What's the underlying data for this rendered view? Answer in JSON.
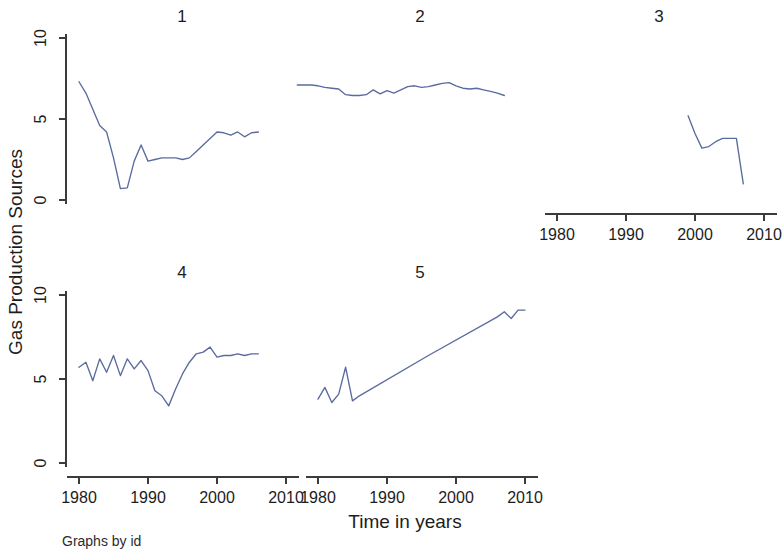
{
  "figure": {
    "ylabel": "Gas Production Sources",
    "xlabel": "Time in years",
    "note": "Graphs by id",
    "line_color": "#5a6b9e",
    "axis_color": "#3b3b3b",
    "background": "#ffffff"
  },
  "axes": {
    "ytick_labels": [
      "0",
      "5",
      "10"
    ],
    "ytick_values": [
      0,
      5,
      10
    ],
    "xtick_labels": [
      "1980",
      "1990",
      "2000",
      "2010"
    ],
    "xtick_values": [
      1980,
      1990,
      2000,
      2010
    ],
    "xlim": [
      1976,
      2013
    ],
    "ylim": [
      -0.7,
      11.2
    ]
  },
  "panels": [
    {
      "title": "1"
    },
    {
      "title": "2"
    },
    {
      "title": "3"
    },
    {
      "title": "4"
    },
    {
      "title": "5"
    }
  ],
  "chart_data": {
    "type": "line",
    "title": "",
    "subtitle": "",
    "xlabel": "Time in years",
    "ylabel": "Gas Production Sources",
    "note": "Graphs by id",
    "layout": "small-multiples, 3 columns x 2 rows, panel 6 empty",
    "grid": false,
    "legend": "none",
    "xlim": [
      1976,
      2013
    ],
    "ylim": [
      -0.7,
      11.2
    ],
    "xticks": [
      1980,
      1990,
      2000,
      2010
    ],
    "yticks": [
      0,
      5,
      10
    ],
    "panels": [
      {
        "id": "1",
        "title": "1",
        "row": 0,
        "col": 0,
        "x": [
          1980,
          1981,
          1982,
          1983,
          1984,
          1985,
          1986,
          1987,
          1988,
          1989,
          1990,
          1991,
          1992,
          1993,
          1994,
          1995,
          1996,
          1997,
          1998,
          1999,
          2000,
          2001,
          2002,
          2003,
          2004,
          2005,
          2006
        ],
        "y": [
          7.3,
          6.6,
          5.6,
          4.6,
          4.2,
          2.6,
          0.7,
          0.75,
          2.4,
          3.4,
          2.4,
          2.5,
          2.6,
          2.6,
          2.6,
          2.5,
          2.6,
          3.0,
          3.4,
          3.8,
          4.2,
          4.15,
          4.0,
          4.2,
          3.9,
          4.15,
          4.2
        ]
      },
      {
        "id": "2",
        "title": "2",
        "row": 0,
        "col": 1,
        "x": [
          1977,
          1978,
          1979,
          1980,
          1981,
          1982,
          1983,
          1984,
          1985,
          1986,
          1987,
          1988,
          1989,
          1990,
          1991,
          1992,
          1993,
          1994,
          1995,
          1996,
          1997,
          1998,
          1999,
          2000,
          2001,
          2002,
          2003,
          2004,
          2005,
          2006,
          2007
        ],
        "y": [
          7.1,
          7.1,
          7.1,
          7.05,
          6.95,
          6.9,
          6.85,
          6.5,
          6.45,
          6.45,
          6.5,
          6.8,
          6.55,
          6.75,
          6.6,
          6.8,
          7.0,
          7.05,
          6.95,
          7.0,
          7.1,
          7.2,
          7.25,
          7.05,
          6.9,
          6.85,
          6.9,
          6.8,
          6.7,
          6.6,
          6.45
        ]
      },
      {
        "id": "3",
        "title": "3",
        "row": 0,
        "col": 2,
        "x": [
          1999,
          2000,
          2001,
          2002,
          2003,
          2004,
          2005,
          2006,
          2007
        ],
        "y": [
          5.2,
          4.1,
          3.2,
          3.3,
          3.6,
          3.8,
          3.8,
          3.8,
          1.0
        ]
      },
      {
        "id": "4",
        "title": "4",
        "row": 1,
        "col": 0,
        "x": [
          1980,
          1981,
          1982,
          1983,
          1984,
          1985,
          1986,
          1987,
          1988,
          1989,
          1990,
          1991,
          1992,
          1993,
          1994,
          1995,
          1996,
          1997,
          1998,
          1999,
          2000,
          2001,
          2002,
          2003,
          2004,
          2005,
          2006
        ],
        "y": [
          5.7,
          6.0,
          4.9,
          6.2,
          5.4,
          6.4,
          5.2,
          6.2,
          5.6,
          6.1,
          5.5,
          4.3,
          4.0,
          3.4,
          4.4,
          5.3,
          6.0,
          6.5,
          6.6,
          6.9,
          6.3,
          6.4,
          6.4,
          6.5,
          6.4,
          6.5,
          6.5
        ]
      },
      {
        "id": "5",
        "title": "5",
        "row": 1,
        "col": 1,
        "x": [
          1980,
          1981,
          1982,
          1983,
          1984,
          1985,
          1986,
          1996,
          2006,
          2007,
          2008,
          2009,
          2010
        ],
        "y": [
          3.8,
          4.5,
          3.6,
          4.1,
          5.7,
          3.7,
          4.0,
          6.4,
          8.7,
          9.0,
          8.6,
          9.1,
          9.1
        ]
      }
    ]
  }
}
